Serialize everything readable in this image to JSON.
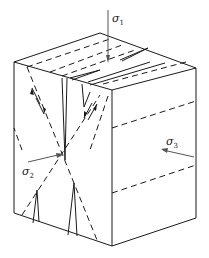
{
  "figure": {
    "type": "stress-cube-fracture-diagram",
    "colors": {
      "line": "#1a1a1a",
      "arrow": "#555555",
      "background": "#ffffff"
    },
    "labels": {
      "sigma1": {
        "symbol": "σ",
        "subscript": "1"
      },
      "sigma2": {
        "symbol": "σ",
        "subscript": "2"
      },
      "sigma3": {
        "symbol": "σ",
        "subscript": "3"
      }
    },
    "vertices": {
      "top_back": [
        100,
        33
      ],
      "top_left": [
        14,
        62
      ],
      "top_right": [
        196,
        68
      ],
      "front_top": [
        112,
        90
      ],
      "bottom_left": [
        14,
        213
      ],
      "bottom_front": [
        112,
        246
      ],
      "bottom_right": [
        196,
        218
      ]
    }
  }
}
